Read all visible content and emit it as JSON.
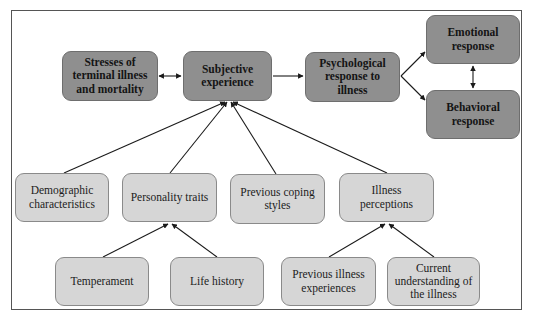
{
  "diagram": {
    "nodes": [
      {
        "id": "stresses",
        "label": "Stresses of terminal illness and mortality",
        "style": "dark"
      },
      {
        "id": "subjective",
        "label": "Subjective experience",
        "style": "dark"
      },
      {
        "id": "psychological",
        "label": "Psychological response to illness",
        "style": "dark"
      },
      {
        "id": "emotional",
        "label": "Emotional response",
        "style": "dark"
      },
      {
        "id": "behavioral",
        "label": "Behavioral response",
        "style": "dark"
      },
      {
        "id": "demographic",
        "label": "Demographic characteristics",
        "style": "light"
      },
      {
        "id": "personality",
        "label": "Personality traits",
        "style": "light"
      },
      {
        "id": "coping",
        "label": "Previous coping styles",
        "style": "light"
      },
      {
        "id": "perceptions",
        "label": "Illness perceptions",
        "style": "light"
      },
      {
        "id": "temperament",
        "label": "Temperament",
        "style": "light"
      },
      {
        "id": "lifehistory",
        "label": "Life history",
        "style": "light"
      },
      {
        "id": "previllness",
        "label": "Previous illness experiences",
        "style": "light"
      },
      {
        "id": "understanding",
        "label": "Current understanding of the illness",
        "style": "light"
      }
    ],
    "edges": [
      {
        "from": "stresses",
        "to": "subjective",
        "type": "bidirectional"
      },
      {
        "from": "subjective",
        "to": "psychological",
        "type": "directed"
      },
      {
        "from": "psychological",
        "to": "emotional",
        "type": "directed"
      },
      {
        "from": "psychological",
        "to": "behavioral",
        "type": "directed"
      },
      {
        "from": "emotional",
        "to": "behavioral",
        "type": "bidirectional"
      },
      {
        "from": "demographic",
        "to": "subjective",
        "type": "directed"
      },
      {
        "from": "personality",
        "to": "subjective",
        "type": "directed"
      },
      {
        "from": "coping",
        "to": "subjective",
        "type": "directed"
      },
      {
        "from": "perceptions",
        "to": "subjective",
        "type": "directed"
      },
      {
        "from": "temperament",
        "to": "personality",
        "type": "directed"
      },
      {
        "from": "lifehistory",
        "to": "personality",
        "type": "directed"
      },
      {
        "from": "previllness",
        "to": "perceptions",
        "type": "directed"
      },
      {
        "from": "understanding",
        "to": "perceptions",
        "type": "directed"
      }
    ],
    "colors": {
      "primary_fill": "#8f8f8f",
      "secondary_fill": "#d6d6d6",
      "line": "#1a1a1a"
    }
  }
}
